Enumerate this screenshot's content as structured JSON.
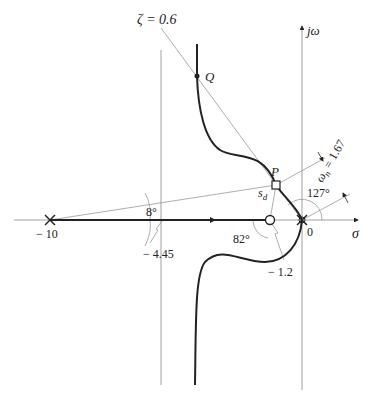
{
  "diagram": {
    "type": "root-locus",
    "axes": {
      "real_label": "σ",
      "imag_label": "jω"
    },
    "labels": {
      "zeta": "ζ = 0.6",
      "point_q": "Q",
      "point_p": "P",
      "sd": "s",
      "sd_sub": "d",
      "omega_n": "ω",
      "omega_n_sub": "n",
      "omega_n_value": " = 1.67",
      "angle_127": "127°",
      "angle_8": "8°",
      "angle_82": "82°",
      "pole_minus10": "− 10",
      "centroid": "− 4.45",
      "zero_minus1_2": "− 1.2",
      "origin": "0"
    },
    "poles": [
      -10,
      0,
      0
    ],
    "zeros": [
      -1.2
    ],
    "asymptote_centroid": -4.45,
    "damping_ratio": 0.6,
    "natural_frequency": 1.67,
    "angles_deg": {
      "at_origin": 127,
      "from_pole_minus10": 8,
      "from_zero": 82
    }
  }
}
